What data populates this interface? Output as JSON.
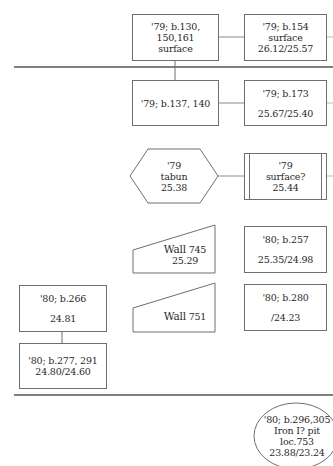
{
  "diagram": {
    "title": "",
    "nodes": {
      "n1": {
        "shape": "rectangle",
        "lines": [
          "'79; b.130, 150,161",
          "surface"
        ]
      },
      "n2": {
        "shape": "rectangle",
        "lines": [
          "'79; b.154",
          "surface",
          "26.12/25.57"
        ]
      },
      "n3": {
        "shape": "rectangle",
        "lines": [
          "'79; b.137, 140"
        ]
      },
      "n4": {
        "shape": "rectangle",
        "lines": [
          "'79; b.173",
          "",
          "25.67/25.40"
        ]
      },
      "n5": {
        "shape": "hexagon",
        "lines": [
          "'79",
          "tabun",
          "25.38"
        ]
      },
      "n6": {
        "shape": "double-rectangle",
        "lines": [
          "'79",
          "surface?",
          "25.44"
        ]
      },
      "n7": {
        "shape": "wall-trapezoid",
        "label": "Wall",
        "number": "745",
        "elevation": "25.29"
      },
      "n8": {
        "shape": "rectangle",
        "lines": [
          "'80; b.257",
          "",
          "25.35/24.98"
        ]
      },
      "n9": {
        "shape": "rectangle",
        "lines": [
          "'80; b.266",
          "",
          "24.81"
        ]
      },
      "n10": {
        "shape": "wall-trapezoid",
        "label": "Wall",
        "number": "751",
        "elevation": ""
      },
      "n11": {
        "shape": "rectangle",
        "lines": [
          "'80; b.280",
          "",
          "/24.23"
        ]
      },
      "n12": {
        "shape": "rectangle",
        "lines": [
          "'80; b.277, 291",
          "24.80/24.60"
        ]
      },
      "n13": {
        "shape": "ellipse",
        "lines": [
          "'80; b.296,305",
          "Iron I? pit",
          "loc.753",
          "23.88/23.24"
        ]
      }
    },
    "edges": [
      {
        "from": "n1",
        "to": "n2"
      },
      {
        "from": "n1",
        "to": "n3"
      },
      {
        "from": "n3",
        "to": "n4"
      },
      {
        "from": "n5",
        "to": "n6"
      },
      {
        "from": "n9",
        "to": "n12"
      }
    ],
    "phase_dividers": [
      {
        "y": 67
      },
      {
        "y": 395
      }
    ],
    "colors": {
      "line": "#6e6e6e",
      "divider": "#555555",
      "text": "#2a2a2a",
      "background": "#ffffff"
    }
  }
}
